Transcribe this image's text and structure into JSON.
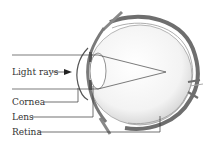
{
  "diagram": {
    "labels": {
      "light_rays": "Light rays",
      "cornea": "Cornea",
      "lens": "Lens",
      "retina": "Retina"
    },
    "colors": {
      "ink": "#333333",
      "sclera": "#6e6e6e",
      "eyeball_fill": "#f2f2f2"
    }
  }
}
